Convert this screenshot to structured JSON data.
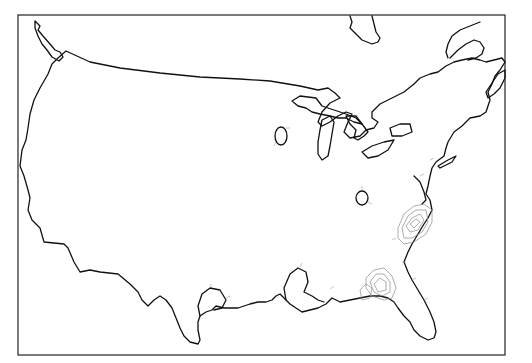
{
  "map": {
    "title": "",
    "region": "Contiguous United States",
    "projection": "Lambert conformal (approx.)",
    "frame": {
      "x": 18,
      "y": 15,
      "width": 487,
      "height": 340
    },
    "colors": {
      "background": "#ffffff",
      "coastline": "#111111",
      "contour": "#8a8a8a",
      "frame": "#222222"
    },
    "features": [
      {
        "name": "us-outline",
        "type": "coastline/border"
      },
      {
        "name": "great-lakes",
        "type": "lakes"
      },
      {
        "name": "great-salt-lake-outline",
        "type": "lake"
      },
      {
        "name": "contour-carolinas",
        "type": "contour-cluster"
      },
      {
        "name": "contour-north-florida",
        "type": "contour-cluster"
      },
      {
        "name": "small-inland-contours",
        "type": "contour-rings"
      }
    ]
  }
}
